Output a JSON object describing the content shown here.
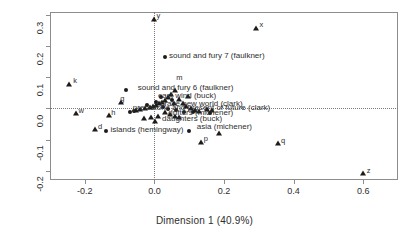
{
  "chart_data": {
    "type": "scatter",
    "title": "",
    "xlabel": "Dimension 1 (40.9%)",
    "ylabel": "Dimension 2 (19.7%)",
    "xlim": [
      -0.3,
      0.7
    ],
    "ylim": [
      -0.23,
      0.31
    ],
    "xticks": [
      -0.2,
      0.0,
      0.2,
      0.4,
      0.6
    ],
    "xticklabels": [
      "-0.2",
      "0.0",
      "0.2",
      "0.4",
      "0.6"
    ],
    "yticks": [
      -0.2,
      -0.1,
      0.0,
      0.1,
      0.2,
      0.3
    ],
    "yticklabels": [
      "-0.2",
      "-0.1",
      "0.0",
      "0.1",
      "0.2",
      "0.3"
    ],
    "grid": false,
    "reference_lines": [
      {
        "axis": "x",
        "value": 0.0,
        "style": "dotted"
      },
      {
        "axis": "y",
        "value": 0.0,
        "style": "dotted"
      }
    ],
    "legend": null,
    "marker_colors": {
      "triangle": "#1c1c1c",
      "circle": "#1c1c1c"
    },
    "series": [
      {
        "name": "categories",
        "marker": "triangle",
        "points": [
          {
            "x": 0.0,
            "y": 0.288,
            "label": "y",
            "label_pos": "right"
          },
          {
            "x": 0.292,
            "y": 0.259,
            "label": "x",
            "label_pos": "right"
          },
          {
            "x": -0.245,
            "y": 0.078,
            "label": "k",
            "label_pos": "right"
          },
          {
            "x": -0.095,
            "y": 0.022,
            "label": "g",
            "label_pos": "top"
          },
          {
            "x": -0.225,
            "y": -0.015,
            "label": "w",
            "label_pos": "top"
          },
          {
            "x": -0.13,
            "y": -0.02,
            "label": "h",
            "label_pos": "top"
          },
          {
            "x": -0.17,
            "y": -0.066,
            "label": "d",
            "label_pos": "right"
          },
          {
            "x": 0.135,
            "y": -0.107,
            "label": "p",
            "label_pos": "right"
          },
          {
            "x": 0.185,
            "y": -0.08,
            "label": "",
            "label_pos": "right"
          },
          {
            "x": 0.355,
            "y": -0.112,
            "label": "q",
            "label_pos": "right"
          },
          {
            "x": 0.6,
            "y": -0.207,
            "label": "z",
            "label_pos": "right"
          },
          {
            "x": 0.06,
            "y": 0.06,
            "label": "",
            "label_pos": "right"
          },
          {
            "x": 0.048,
            "y": 0.048,
            "label": "",
            "label_pos": "right"
          },
          {
            "x": 0.038,
            "y": 0.036,
            "label": "",
            "label_pos": "right"
          },
          {
            "x": 0.03,
            "y": 0.028,
            "label": "",
            "label_pos": "right"
          },
          {
            "x": 0.022,
            "y": 0.022,
            "label": "",
            "label_pos": "right"
          },
          {
            "x": 0.014,
            "y": 0.016,
            "label": "",
            "label_pos": "right"
          },
          {
            "x": 0.006,
            "y": 0.012,
            "label": "",
            "label_pos": "right"
          },
          {
            "x": -0.004,
            "y": 0.008,
            "label": "",
            "label_pos": "right"
          },
          {
            "x": -0.014,
            "y": 0.004,
            "label": "",
            "label_pos": "right"
          },
          {
            "x": -0.026,
            "y": 0.0,
            "label": "",
            "label_pos": "right"
          },
          {
            "x": -0.04,
            "y": -0.002,
            "label": "",
            "label_pos": "right"
          },
          {
            "x": -0.052,
            "y": -0.006,
            "label": "",
            "label_pos": "right"
          },
          {
            "x": 0.07,
            "y": 0.03,
            "label": "",
            "label_pos": "right"
          },
          {
            "x": 0.082,
            "y": 0.018,
            "label": "",
            "label_pos": "right"
          },
          {
            "x": 0.092,
            "y": 0.008,
            "label": "",
            "label_pos": "right"
          },
          {
            "x": 0.104,
            "y": 0.002,
            "label": "",
            "label_pos": "right"
          },
          {
            "x": 0.116,
            "y": -0.004,
            "label": "",
            "label_pos": "right"
          },
          {
            "x": 0.128,
            "y": -0.008,
            "label": "",
            "label_pos": "right"
          },
          {
            "x": 0.03,
            "y": -0.012,
            "label": "",
            "label_pos": "right"
          },
          {
            "x": 0.044,
            "y": -0.018,
            "label": "",
            "label_pos": "right"
          },
          {
            "x": 0.058,
            "y": -0.024,
            "label": "",
            "label_pos": "right"
          },
          {
            "x": 0.072,
            "y": -0.028,
            "label": "",
            "label_pos": "right"
          },
          {
            "x": 0.01,
            "y": -0.024,
            "label": "",
            "label_pos": "right"
          },
          {
            "x": -0.01,
            "y": -0.026,
            "label": "",
            "label_pos": "right"
          },
          {
            "x": -0.03,
            "y": -0.03,
            "label": "",
            "label_pos": "right"
          },
          {
            "x": 0.002,
            "y": -0.04,
            "label": "",
            "label_pos": "right"
          },
          {
            "x": 0.096,
            "y": 0.04,
            "label": "",
            "label_pos": "right"
          },
          {
            "x": 0.056,
            "y": 0.016,
            "label": "",
            "label_pos": "right"
          },
          {
            "x": 0.15,
            "y": -0.002,
            "label": "",
            "label_pos": "right"
          },
          {
            "x": 0.166,
            "y": -0.006,
            "label": "",
            "label_pos": "right"
          }
        ]
      },
      {
        "name": "documents",
        "marker": "circle",
        "points": [
          {
            "x": 0.03,
            "y": 0.165,
            "label": "sound and fury 7 (faulkner)",
            "label_pos": "right"
          },
          {
            "x": -0.082,
            "y": 0.06,
            "label": "",
            "label_pos": "right"
          },
          {
            "x": 0.018,
            "y": 0.038,
            "label": "",
            "label_pos": "right"
          },
          {
            "x": -0.06,
            "y": -0.008,
            "label": "",
            "label_pos": "right"
          },
          {
            "x": -0.07,
            "y": -0.01,
            "label": "",
            "label_pos": "right"
          },
          {
            "x": 0.026,
            "y": 0.004,
            "label": "",
            "label_pos": "right"
          },
          {
            "x": 0.04,
            "y": -0.002,
            "label": "",
            "label_pos": "right"
          },
          {
            "x": 0.062,
            "y": -0.006,
            "label": "",
            "label_pos": "right"
          },
          {
            "x": 0.086,
            "y": -0.01,
            "label": "",
            "label_pos": "right"
          },
          {
            "x": 0.112,
            "y": -0.012,
            "label": "",
            "label_pos": "right"
          },
          {
            "x": 0.16,
            "y": -0.016,
            "label": "",
            "label_pos": "right"
          },
          {
            "x": -0.14,
            "y": -0.072,
            "label": "islands (hemingway)",
            "label_pos": "right"
          },
          {
            "x": 0.1,
            "y": -0.072,
            "label": "asia (michener)",
            "label_pos": "right"
          },
          {
            "x": 0.006,
            "y": 0.02,
            "label": "",
            "label_pos": "right"
          },
          {
            "x": -0.02,
            "y": 0.012,
            "label": "",
            "label_pos": "right"
          },
          {
            "x": 0.05,
            "y": 0.026,
            "label": "",
            "label_pos": "right"
          }
        ]
      }
    ],
    "annotations": [
      {
        "text": "sound and fury 7 (faulkner)",
        "x": 0.042,
        "y": 0.172
      },
      {
        "text": "m",
        "x": 0.063,
        "y": 0.102
      },
      {
        "text": "sound and fury 6 (faulkner)",
        "x": -0.048,
        "y": 0.068
      },
      {
        "text": "east wind (buck)",
        "x": 0.01,
        "y": 0.044
      },
      {
        "text": "g",
        "x": -0.098,
        "y": 0.034
      },
      {
        "text": "k",
        "x": -0.233,
        "y": 0.09
      },
      {
        "text": "y",
        "x": 0.006,
        "y": 0.299
      },
      {
        "text": "x",
        "x": 0.302,
        "y": 0.27
      },
      {
        "text": "brave new world (clark)",
        "x": 0.016,
        "y": 0.018
      },
      {
        "text": "prehistoric and present of future (clark)",
        "x": -0.062,
        "y": 0.006
      },
      {
        "text": "drifters (michener)",
        "x": 0.04,
        "y": -0.012
      },
      {
        "text": "daughters (buck)",
        "x": 0.022,
        "y": -0.03
      },
      {
        "text": "islands (hemingway)",
        "x": -0.126,
        "y": -0.066
      },
      {
        "text": "asia (michener)",
        "x": 0.122,
        "y": -0.058
      },
      {
        "text": "w",
        "x": -0.218,
        "y": -0.006
      },
      {
        "text": "h",
        "x": -0.124,
        "y": -0.01
      },
      {
        "text": "d",
        "x": -0.162,
        "y": -0.056
      },
      {
        "text": "p",
        "x": 0.142,
        "y": -0.096
      },
      {
        "text": "q",
        "x": 0.364,
        "y": -0.102
      },
      {
        "text": "z",
        "x": 0.61,
        "y": -0.197
      }
    ]
  }
}
